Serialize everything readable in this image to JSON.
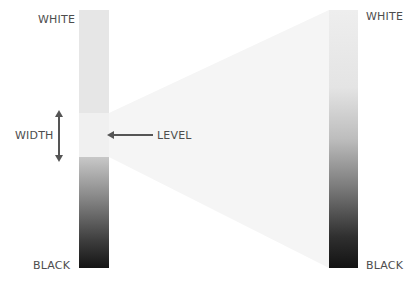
{
  "diagram": {
    "left_bar": {
      "top_label": "WHITE",
      "bottom_label": "BLACK",
      "width_label": "WIDTH",
      "level_label": "LEVEL"
    },
    "right_bar": {
      "top_label": "WHITE",
      "bottom_label": "BLACK"
    },
    "colors": {
      "text": "#4d4d4d",
      "arrow": "#555555",
      "funnel": "#f4f4f4"
    }
  }
}
